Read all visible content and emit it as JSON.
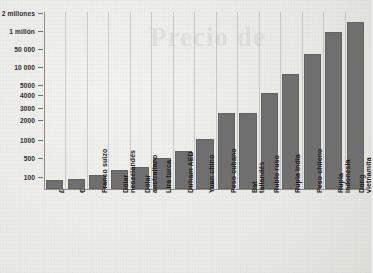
{
  "chart_data": {
    "type": "bar",
    "title": "",
    "subtitle": "",
    "xlabel": "",
    "ylabel": "",
    "grid": "vertical",
    "legend": "none",
    "axis_note": "Eje Y con escala irregular / no lineal",
    "watermark": "Precio de",
    "ytick_labels": [
      "2 millones",
      "1 millón",
      "50 000",
      "10 000",
      "5000",
      "4000",
      "3000",
      "2000",
      "1000",
      "500",
      "100"
    ],
    "ytick_values": [
      2000000,
      1000000,
      50000,
      10000,
      5000,
      4000,
      3000,
      2000,
      1000,
      500,
      100
    ],
    "ytick_pixel_y": [
      13,
      31,
      49,
      67,
      85,
      95,
      108,
      120,
      140,
      158,
      177
    ],
    "categories": [
      "£",
      "€",
      "Franco suizo",
      "Dólar neozelandés",
      "Dólar australiano",
      "Lira turca",
      "Dirham AED",
      "Yuan chino",
      "Peso cubano",
      "Bat tailandés",
      "Rublo ruso",
      "Rupia india",
      "Peso chileno",
      "Rupia indonesia",
      "Dong vietnamita"
    ],
    "values": [
      80,
      90,
      115,
      150,
      175,
      300,
      400,
      700,
      2500,
      2600,
      4000,
      7000,
      20000,
      700000,
      1700000
    ],
    "bar_pixel_heights": [
      9,
      10,
      14,
      19,
      22,
      31,
      38,
      50,
      76,
      76,
      96,
      115,
      135,
      157,
      167
    ],
    "series": [
      {
        "name": "Valor",
        "values": [
          80,
          90,
          115,
          150,
          175,
          300,
          400,
          700,
          2500,
          2600,
          4000,
          7000,
          20000,
          700000,
          1700000
        ]
      }
    ],
    "colors": {
      "bar": "#6f6f6f",
      "background": "#e9e9e6",
      "axis": "#8d8d8a",
      "grid": "#787876",
      "text": "#1d1d1d"
    }
  }
}
